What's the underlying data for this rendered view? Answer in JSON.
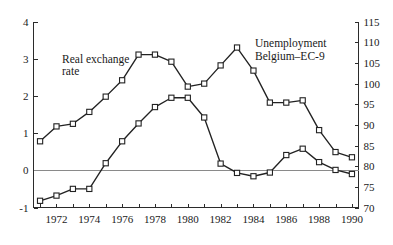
{
  "chart_data": {
    "type": "line",
    "title": "",
    "subtitle": "",
    "xlabel": "",
    "ylabel": "",
    "grid": false,
    "legend_position": "inline-annotations",
    "x": [
      1971,
      1972,
      1973,
      1974,
      1975,
      1976,
      1977,
      1978,
      1979,
      1980,
      1981,
      1982,
      1983,
      1984,
      1985,
      1986,
      1987,
      1988,
      1989,
      1990
    ],
    "x_tick_labels": [
      "1972",
      "1974",
      "1976",
      "1978",
      "1980",
      "1982",
      "1984",
      "1986",
      "1988",
      "1990"
    ],
    "x_tick_values": [
      1972,
      1974,
      1976,
      1978,
      1980,
      1982,
      1984,
      1986,
      1988,
      1990
    ],
    "xlim": [
      1970.6,
      1990.4
    ],
    "axes": [
      {
        "id": "left",
        "name": "Real exchange rate",
        "side": "left",
        "lim": [
          -1,
          4
        ],
        "ticks": [
          -1,
          0,
          1,
          2,
          3,
          4
        ],
        "tick_labels": [
          "-1",
          "0",
          "1",
          "2",
          "3",
          "4"
        ]
      },
      {
        "id": "right",
        "name": "Unemployment Belgium-EC-9",
        "side": "right",
        "lim": [
          70,
          115
        ],
        "ticks": [
          70,
          75,
          80,
          85,
          90,
          95,
          100,
          105,
          110,
          115
        ],
        "tick_labels": [
          "70",
          "75",
          "80",
          "85",
          "90",
          "95",
          "100",
          "105",
          "110",
          "115"
        ]
      }
    ],
    "series": [
      {
        "name": "Real exchange rate",
        "axis": "left",
        "marker": "open-square",
        "values": [
          0.78,
          1.18,
          1.25,
          1.57,
          1.98,
          2.42,
          3.11,
          3.11,
          2.92,
          2.25,
          2.33,
          2.82,
          3.3,
          2.68,
          1.82,
          1.82,
          1.88,
          1.08,
          0.49,
          0.35
        ]
      },
      {
        "name": "Unemployment Belgium-EC-9",
        "axis": "left",
        "marker": "open-square",
        "values": [
          -0.82,
          -0.68,
          -0.5,
          -0.5,
          0.19,
          0.78,
          1.26,
          1.7,
          1.95,
          1.95,
          1.42,
          0.18,
          -0.07,
          -0.16,
          -0.06,
          0.41,
          0.58,
          0.22,
          0.01,
          -0.1
        ]
      }
    ],
    "series_right_scale": [
      {
        "name": "Unemployment Belgium-EC-9",
        "axis": "right",
        "values": [
          72.6,
          73.9,
          75.5,
          75.5,
          81.7,
          87.0,
          91.3,
          95.3,
          97.6,
          97.6,
          92.8,
          81.6,
          79.4,
          78.6,
          79.5,
          83.7,
          85.2,
          82.0,
          80.1,
          79.1
        ]
      }
    ],
    "annotations": [
      {
        "id": "label-real-exchange-rate",
        "text_line1": "Real exchange",
        "text_line2": "rate",
        "x": 1972.2,
        "y_left": 3.0
      },
      {
        "id": "label-unemployment",
        "text_line1": "Unemployment",
        "text_line2": "Belgium–EC-9",
        "x": 1984.4,
        "y_left": 3.45
      }
    ],
    "colors": {
      "line": "#222222",
      "marker_fill": "#ffffff",
      "axis": "#2b2b2b",
      "zero_line": "#8a8a8a",
      "background": "#ffffff"
    }
  },
  "labels": {
    "left_axis": {
      "t4": "4",
      "t3": "3",
      "t2": "2",
      "t1": "1",
      "t0": "0",
      "tm1": "-1"
    },
    "right_axis": {
      "t115": "115",
      "t110": "110",
      "t105": "105",
      "t100": "100",
      "t95": "95",
      "t90": "90",
      "t85": "85",
      "t80": "80",
      "t75": "75",
      "t70": "70"
    },
    "x_axis": {
      "x1972": "1972",
      "x1974": "1974",
      "x1976": "1976",
      "x1978": "1978",
      "x1980": "1980",
      "x1982": "1982",
      "x1984": "1984",
      "x1986": "1986",
      "x1988": "1988",
      "x1990": "1990"
    },
    "annotation_real_exchange_line1": "Real exchange",
    "annotation_real_exchange_line2": "rate",
    "annotation_unemployment_line1": "Unemployment",
    "annotation_unemployment_line2": "Belgium–EC-9"
  }
}
